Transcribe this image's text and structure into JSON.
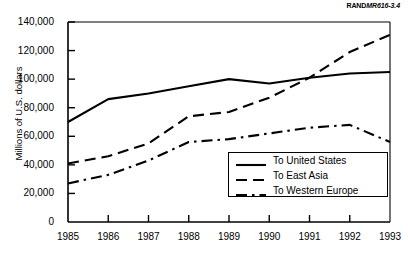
{
  "source_id": {
    "prefix": "RAND",
    "code": "MR616-3.4"
  },
  "axes": {
    "ylabel": "Millions of U.S. dollars",
    "yticks": [
      "0",
      "20,000",
      "40,000",
      "60,000",
      "80,000",
      "100,000",
      "120,000",
      "140,000"
    ],
    "xticks": [
      "1985",
      "1986",
      "1987",
      "1988",
      "1989",
      "1990",
      "1991",
      "1992",
      "1993"
    ]
  },
  "legend": {
    "items": [
      {
        "label": "To United States",
        "style": "solid"
      },
      {
        "label": "To East Asia",
        "style": "dashed"
      },
      {
        "label": "To Western Europe",
        "style": "dashdot"
      }
    ]
  },
  "chart_data": {
    "type": "line",
    "title": "",
    "xlabel": "",
    "ylabel": "Millions of U.S. dollars",
    "x": [
      1985,
      1986,
      1987,
      1988,
      1989,
      1990,
      1991,
      1992,
      1993
    ],
    "categories": [
      "1985",
      "1986",
      "1987",
      "1988",
      "1989",
      "1990",
      "1991",
      "1992",
      "1993"
    ],
    "ylim": [
      0,
      140000
    ],
    "ytick_values": [
      0,
      20000,
      40000,
      60000,
      80000,
      100000,
      120000,
      140000
    ],
    "grid": false,
    "legend_position": "inside-lower-right",
    "series": [
      {
        "name": "To United States",
        "style": "solid",
        "color": "#000000",
        "values": [
          70000,
          86000,
          90000,
          95000,
          100000,
          97000,
          101000,
          104000,
          105000
        ]
      },
      {
        "name": "To East Asia",
        "style": "dashed",
        "color": "#000000",
        "values": [
          41000,
          46000,
          55000,
          74000,
          77000,
          87000,
          101000,
          119000,
          131000
        ]
      },
      {
        "name": "To Western Europe",
        "style": "dashdot",
        "color": "#000000",
        "values": [
          27000,
          33000,
          43000,
          56000,
          58000,
          62000,
          66000,
          68000,
          56000
        ]
      }
    ]
  }
}
